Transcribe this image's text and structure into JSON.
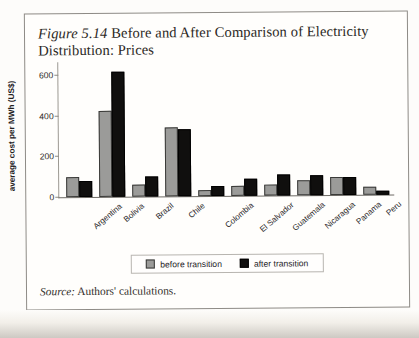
{
  "figure": {
    "number": "Figure 5.14",
    "title": " Before and After Comparison of Electricity Distribution: Prices",
    "source_label": "Source:",
    "source_text": " Authors' calculations."
  },
  "legend": {
    "before_label": "before transition",
    "after_label": "after transition",
    "before_color": "#9b9b99",
    "after_color": "#100f0e"
  },
  "axes": {
    "y_title": "average cost per MWh (US$)",
    "y_ticks": [
      "0",
      "200",
      "400",
      "600"
    ]
  },
  "chart_data": {
    "type": "bar",
    "title": "Figure 5.14 Before and After Comparison of Electricity Distribution: Prices",
    "xlabel": "",
    "ylabel": "average cost per MWh (US$)",
    "ylim": [
      0,
      650
    ],
    "yticks": [
      0,
      200,
      400,
      600
    ],
    "grid": false,
    "legend_position": "bottom-center",
    "categories": [
      "Argentina",
      "Bolivia",
      "Brazil",
      "Chile",
      "Colombia",
      "El Salvador",
      "Guatemala",
      "Nicaragua",
      "Panama",
      "Peru"
    ],
    "series": [
      {
        "name": "before transition",
        "color": "#9b9b99",
        "values": [
          100,
          425,
          60,
          340,
          30,
          50,
          55,
          75,
          90,
          40
        ]
      },
      {
        "name": "after transition",
        "color": "#100f0e",
        "values": [
          80,
          615,
          100,
          330,
          50,
          85,
          105,
          100,
          90,
          20
        ]
      }
    ],
    "source": "Authors' calculations."
  }
}
